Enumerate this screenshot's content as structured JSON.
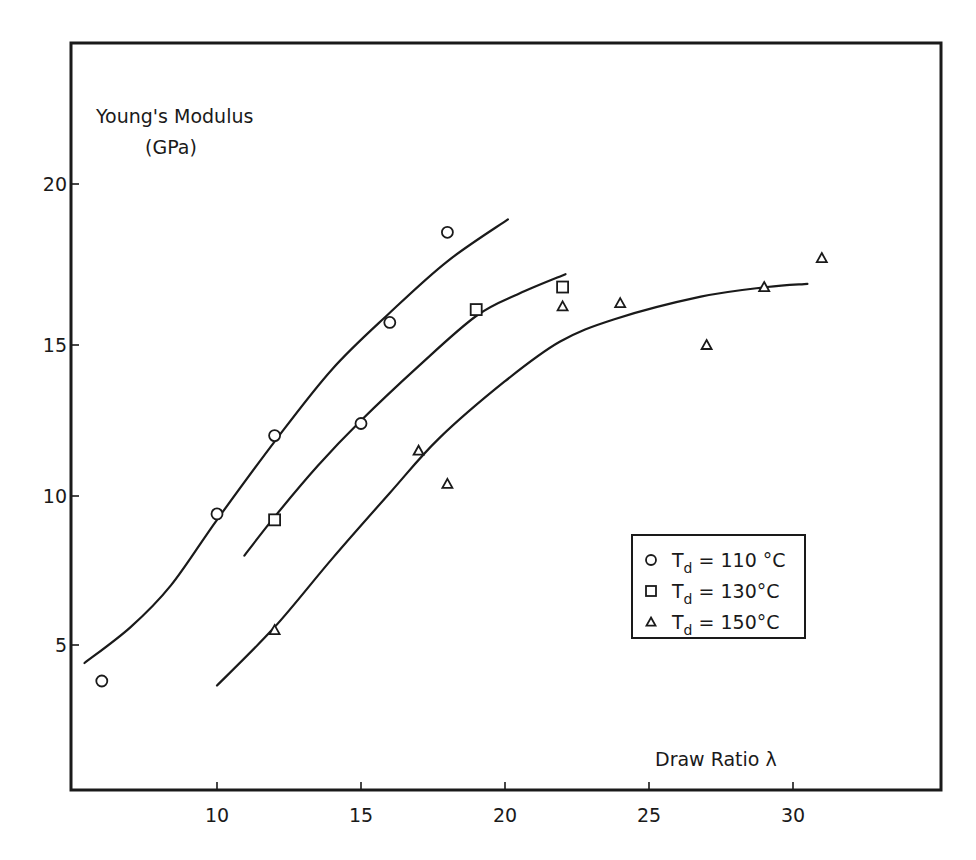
{
  "chart_data": {
    "type": "scatter",
    "title": "",
    "ylabel": "Young's Modulus",
    "ylabel_unit": "(GPa)",
    "xlabel": "Draw Ratio λ",
    "xlim": [
      5,
      35
    ],
    "ylim": [
      0,
      24
    ],
    "x_ticks": [
      10,
      15,
      20,
      25,
      30
    ],
    "x_tick_labels": [
      "10",
      "15",
      "20",
      "25",
      "30"
    ],
    "y_ticks": [
      5,
      10,
      15,
      20
    ],
    "y_tick_labels": [
      "5",
      "10",
      "15",
      "20"
    ],
    "grid": false,
    "legend_position": "bottom-right",
    "series": [
      {
        "name": "Td = 110°C",
        "legend_prefix": "T",
        "legend_subscript": "d",
        "legend_value": "= 110 °C",
        "marker": "circle",
        "points": [
          {
            "x": 6,
            "y": 3.8
          },
          {
            "x": 10,
            "y": 9.4
          },
          {
            "x": 12,
            "y": 12.0
          },
          {
            "x": 15,
            "y": 12.4
          },
          {
            "x": 16,
            "y": 15.7
          },
          {
            "x": 18,
            "y": 18.5
          }
        ],
        "fit_curve": [
          {
            "x": 5.4,
            "y": 4.4
          },
          {
            "x": 7,
            "y": 5.6
          },
          {
            "x": 8.4,
            "y": 7.0
          },
          {
            "x": 10,
            "y": 9.2
          },
          {
            "x": 12,
            "y": 11.8
          },
          {
            "x": 14,
            "y": 14.2
          },
          {
            "x": 16,
            "y": 16.0
          },
          {
            "x": 18,
            "y": 17.6
          },
          {
            "x": 20.1,
            "y": 18.9
          }
        ]
      },
      {
        "name": "Td = 130°C",
        "legend_prefix": "T",
        "legend_subscript": "d",
        "legend_value": "= 130°C",
        "marker": "square",
        "points": [
          {
            "x": 12,
            "y": 9.2
          },
          {
            "x": 19,
            "y": 16.1
          },
          {
            "x": 22,
            "y": 16.8
          }
        ],
        "fit_curve": [
          {
            "x": 10.95,
            "y": 8.0
          },
          {
            "x": 12,
            "y": 9.3
          },
          {
            "x": 13.5,
            "y": 11.0
          },
          {
            "x": 15,
            "y": 12.5
          },
          {
            "x": 17,
            "y": 14.3
          },
          {
            "x": 19,
            "y": 15.9
          },
          {
            "x": 20.5,
            "y": 16.6
          },
          {
            "x": 22.1,
            "y": 17.2
          }
        ]
      },
      {
        "name": "Td = 150°C",
        "legend_prefix": "T",
        "legend_subscript": "d",
        "legend_value": "= 150°C",
        "marker": "triangle",
        "points": [
          {
            "x": 12,
            "y": 5.5
          },
          {
            "x": 17,
            "y": 11.5
          },
          {
            "x": 18,
            "y": 10.4
          },
          {
            "x": 22,
            "y": 16.2
          },
          {
            "x": 24,
            "y": 16.3
          },
          {
            "x": 27,
            "y": 15.0
          },
          {
            "x": 29,
            "y": 16.8
          },
          {
            "x": 31,
            "y": 17.7
          }
        ],
        "fit_curve": [
          {
            "x": 10.0,
            "y": 3.65
          },
          {
            "x": 12,
            "y": 5.6
          },
          {
            "x": 14,
            "y": 7.9
          },
          {
            "x": 16,
            "y": 10.1
          },
          {
            "x": 17.7,
            "y": 11.9
          },
          {
            "x": 20,
            "y": 13.8
          },
          {
            "x": 21.9,
            "y": 15.1
          },
          {
            "x": 23.8,
            "y": 15.8
          },
          {
            "x": 26.8,
            "y": 16.5
          },
          {
            "x": 29.1,
            "y": 16.8
          },
          {
            "x": 30.5,
            "y": 16.9
          }
        ]
      }
    ]
  }
}
